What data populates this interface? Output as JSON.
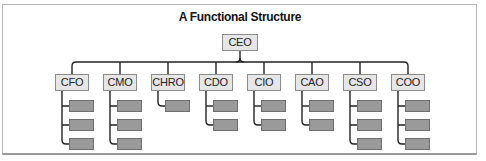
{
  "diagram": {
    "title": "A Functional Structure",
    "root": {
      "label": "CEO"
    },
    "departments": [
      {
        "label": "CFO",
        "children": 3
      },
      {
        "label": "CMO",
        "children": 3
      },
      {
        "label": "CHRO",
        "children": 1
      },
      {
        "label": "CDO",
        "children": 2
      },
      {
        "label": "CIO",
        "children": 2
      },
      {
        "label": "CAO",
        "children": 2
      },
      {
        "label": "CSO",
        "children": 3
      },
      {
        "label": "COO",
        "children": 3
      }
    ],
    "colors": {
      "box_fill": "#e6e6e6",
      "box_border": "#8c8c8c",
      "child_fill": "#9a9a9a",
      "line": "#222222"
    }
  }
}
